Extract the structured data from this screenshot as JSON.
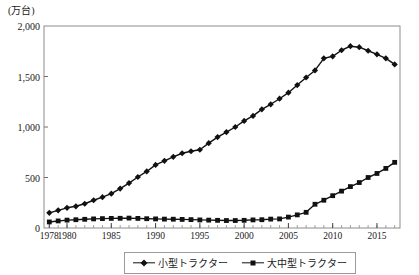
{
  "chart_data": {
    "type": "line",
    "title": "",
    "unit_label": "(万台)",
    "xlabel": "",
    "ylabel": "",
    "xlim": [
      1977.4,
      2017.6
    ],
    "ylim": [
      0,
      2000
    ],
    "grid": false,
    "legend_position": "bottom-center",
    "ytick_labels": [
      "0",
      "500",
      "1,000",
      "1,500",
      "2,000"
    ],
    "ytick_values": [
      0,
      500,
      1000,
      1500,
      2000
    ],
    "xtick_labels": [
      "1978",
      "1980",
      "1985",
      "1990",
      "1995",
      "2000",
      "2005",
      "2010",
      "2015"
    ],
    "xtick_values": [
      1978,
      1980,
      1985,
      1990,
      1995,
      2000,
      2005,
      2010,
      2015
    ],
    "x": [
      1978,
      1979,
      1980,
      1981,
      1982,
      1983,
      1984,
      1985,
      1986,
      1987,
      1988,
      1989,
      1990,
      1991,
      1992,
      1993,
      1994,
      1995,
      1996,
      1997,
      1998,
      1999,
      2000,
      2001,
      2002,
      2003,
      2004,
      2005,
      2006,
      2007,
      2008,
      2009,
      2010,
      2011,
      2012,
      2013,
      2014,
      2015,
      2016,
      2017
    ],
    "series": [
      {
        "name": "小型トラクター",
        "marker": "diamond",
        "color": "#111111",
        "values": [
          150,
          175,
          200,
          215,
          240,
          275,
          305,
          340,
          390,
          445,
          505,
          560,
          625,
          665,
          705,
          740,
          760,
          775,
          840,
          900,
          950,
          1000,
          1060,
          1110,
          1175,
          1225,
          1280,
          1340,
          1415,
          1490,
          1560,
          1680,
          1700,
          1760,
          1800,
          1790,
          1755,
          1720,
          1680,
          1620
        ]
      },
      {
        "name": "大中型トラクター",
        "marker": "square",
        "color": "#111111",
        "values": [
          60,
          70,
          78,
          82,
          86,
          90,
          93,
          95,
          96,
          98,
          95,
          92,
          90,
          88,
          87,
          85,
          83,
          80,
          78,
          76,
          74,
          74,
          76,
          80,
          82,
          88,
          90,
          108,
          130,
          155,
          235,
          275,
          320,
          365,
          410,
          450,
          500,
          540,
          590,
          650
        ]
      }
    ]
  },
  "legend": {
    "entries": [
      {
        "label": "小型トラクター",
        "marker": "diamond"
      },
      {
        "label": "大中型トラクター",
        "marker": "square"
      }
    ]
  }
}
